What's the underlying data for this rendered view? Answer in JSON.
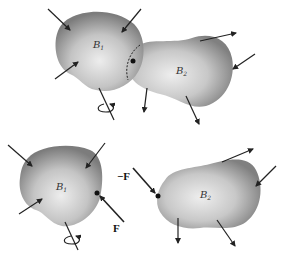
{
  "diagram": {
    "top_panel": {
      "description": "Two bodies in contact",
      "body1": {
        "label": "B",
        "subscript": "1"
      },
      "body2": {
        "label": "B",
        "subscript": "2"
      }
    },
    "bottom_panel": {
      "description": "Free body diagrams separated with action-reaction forces",
      "body1": {
        "label": "B",
        "subscript": "1"
      },
      "body2": {
        "label": "B",
        "subscript": "2"
      },
      "force_on_body1": "F",
      "force_on_body2": "−F"
    },
    "colors": {
      "body_fill_dark": "#7a7a7a",
      "body_fill_light": "#e6e6e6",
      "arrow": "#222222",
      "background": "#ffffff"
    }
  }
}
